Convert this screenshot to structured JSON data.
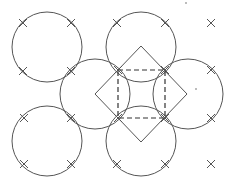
{
  "diagram": {
    "width": 232,
    "height": 187,
    "stroke_color": "#555555",
    "background": "#ffffff",
    "circles": [
      {
        "id": "top-left",
        "cx": 47,
        "cy": 47,
        "r": 35
      },
      {
        "id": "top-middle",
        "cx": 141,
        "cy": 47,
        "r": 35
      },
      {
        "id": "middle-left",
        "cx": 95,
        "cy": 94,
        "r": 35
      },
      {
        "id": "middle-right",
        "cx": 188,
        "cy": 94,
        "r": 35
      },
      {
        "id": "bottom-left",
        "cx": 47,
        "cy": 141,
        "r": 35
      },
      {
        "id": "bottom-middle",
        "cx": 141,
        "cy": 141,
        "r": 35
      }
    ],
    "diamond": {
      "top": [
        141,
        46
      ],
      "right": [
        187,
        94
      ],
      "bottom": [
        141,
        142
      ],
      "left": [
        95,
        94
      ]
    },
    "dashed_square": {
      "x": 118,
      "y": 70,
      "width": 47,
      "height": 48
    },
    "crosses": [
      [
        23,
        23
      ],
      [
        71,
        23
      ],
      [
        117,
        23
      ],
      [
        165,
        23
      ],
      [
        211,
        23
      ],
      [
        23,
        71
      ],
      [
        71,
        71
      ],
      [
        118,
        70
      ],
      [
        165,
        70
      ],
      [
        211,
        70
      ],
      [
        24,
        118
      ],
      [
        71,
        118
      ],
      [
        118,
        118
      ],
      [
        165,
        118
      ],
      [
        211,
        118
      ],
      [
        24,
        164
      ],
      [
        71,
        164
      ],
      [
        117,
        164
      ],
      [
        165,
        164
      ],
      [
        211,
        164
      ]
    ],
    "dots": [
      [
        196,
        89
      ],
      [
        186,
        3
      ]
    ]
  }
}
